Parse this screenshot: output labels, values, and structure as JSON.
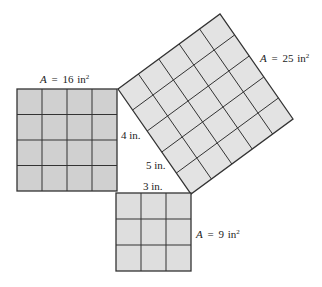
{
  "figure": {
    "type": "pythagorean-theorem-squares",
    "colors": {
      "left_fill": "#d0d0d0",
      "tilted_fill": "#e3e3e3",
      "bottom_fill": "#dedede",
      "line": "#333333",
      "text": "#222222"
    },
    "squares": [
      {
        "id": "left",
        "side_units": 4,
        "area_var": "A",
        "area_eq": "=",
        "area_value": "16",
        "area_unit": "in",
        "area_exp": "2"
      },
      {
        "id": "tilted",
        "side_units": 5,
        "area_var": "A",
        "area_eq": "=",
        "area_value": "25",
        "area_unit": "in",
        "area_exp": "2"
      },
      {
        "id": "bottom",
        "side_units": 3,
        "area_var": "A",
        "area_eq": "=",
        "area_value": "9",
        "area_unit": "in",
        "area_exp": "2"
      }
    ],
    "side_labels": {
      "left_leg": "4 in.",
      "hypotenuse": "5 in.",
      "bottom_leg": "3 in."
    }
  }
}
